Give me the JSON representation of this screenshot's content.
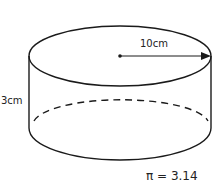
{
  "diagram": {
    "shape": "cylinder",
    "radius_label": "10cm",
    "height_label": "3cm",
    "pi_note": "π = 3.14",
    "stroke_color": "#1a1a1a",
    "text_color": "#222222"
  }
}
